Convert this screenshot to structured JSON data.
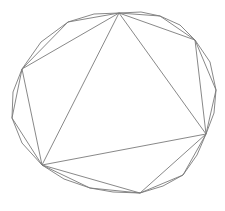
{
  "diagram": {
    "stroke_color": "#7a7a7a",
    "background": "#ffffff",
    "polygons": {
      "triangle": "119,13 206,134 42,165",
      "hexagon": "119,13 195,40 206,134 140,193 42,165 22,69",
      "dodecagon": "119,13 160,16 195,40 216,90 206,134 183,175 140,193 90,188 42,165 12,118 22,69 68,22",
      "icositetragon": "119,13 141,12 160,16 180,25 195,40 210,62 216,90 214,113 206,134 197,155 183,175 163,186 140,193 113,192 90,188 64,179 42,165 22,143 12,118 13,92 22,69 41,42 68,22 94,14"
    }
  }
}
